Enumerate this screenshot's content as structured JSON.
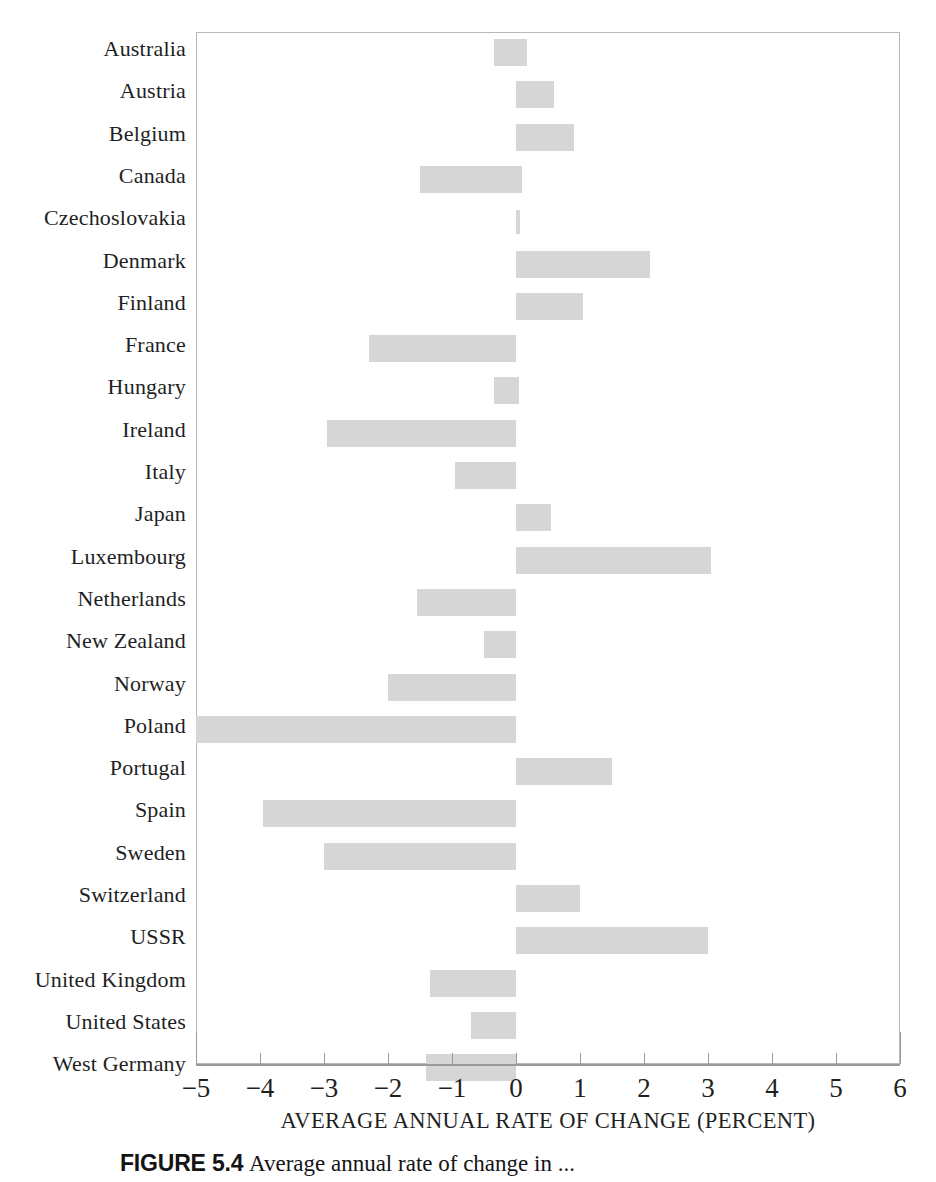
{
  "chart_data": {
    "type": "bar",
    "orientation": "horizontal",
    "title": "",
    "xlabel": "AVERAGE ANNUAL RATE OF CHANGE (PERCENT)",
    "ylabel": "",
    "xlim": [
      -5,
      6
    ],
    "xticks": [
      -5,
      -4,
      -3,
      -2,
      -1,
      0,
      1,
      2,
      3,
      4,
      5,
      6
    ],
    "xtick_labels": [
      "−5",
      "−4",
      "−3",
      "−2",
      "−1",
      "0",
      "1",
      "2",
      "3",
      "4",
      "5",
      "6"
    ],
    "grid": false,
    "legend": "none",
    "bar_color": "#d6d6d6",
    "categories": [
      "Australia",
      "Austria",
      "Belgium",
      "Canada",
      "Czechoslovakia",
      "Denmark",
      "Finland",
      "France",
      "Hungary",
      "Ireland",
      "Italy",
      "Japan",
      "Luxembourg",
      "Netherlands",
      "New Zealand",
      "Norway",
      "Poland",
      "Portugal",
      "Spain",
      "Sweden",
      "Switzerland",
      "USSR",
      "United Kingdom",
      "United States",
      "West Germany"
    ],
    "values": [
      -0.35,
      0.6,
      0.9,
      -1.5,
      0.05,
      2.1,
      1.05,
      -2.3,
      -0.35,
      -2.95,
      -0.95,
      0.55,
      3.05,
      -1.55,
      -0.5,
      -2.0,
      -5.0,
      1.5,
      -3.95,
      -3.0,
      1.0,
      3.0,
      -1.35,
      -0.7,
      -1.4
    ],
    "bar_starts": [
      -0.35,
      0.0,
      0.0,
      -1.5,
      0.0,
      0.0,
      0.0,
      -2.3,
      -0.35,
      -2.95,
      -0.95,
      0.0,
      0.0,
      -1.55,
      -0.5,
      -2.0,
      -5.0,
      0.0,
      -3.95,
      -3.0,
      0.0,
      0.0,
      -1.35,
      -0.7,
      -1.4
    ],
    "bar_ends": [
      0.17,
      0.6,
      0.9,
      0.1,
      0.05,
      2.1,
      1.05,
      0.0,
      0.05,
      0.0,
      0.0,
      0.55,
      3.05,
      0.0,
      0.0,
      0.0,
      0.0,
      1.5,
      0.0,
      0.0,
      1.0,
      3.0,
      0.0,
      0.0,
      0.0
    ]
  },
  "caption": {
    "number": "FIGURE 5.4",
    "text": "Average annual rate of change in  ..."
  }
}
